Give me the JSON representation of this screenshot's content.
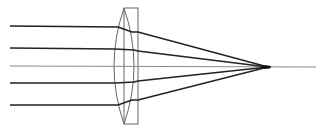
{
  "diagram": {
    "title": "",
    "elements": {
      "lens": "plano-convex lens",
      "rays": [
        "ray-1",
        "ray-2",
        "optical-axis",
        "ray-4",
        "ray-5"
      ],
      "focal_point": "focal-point"
    },
    "colors": {
      "ray": "#222222",
      "axis": "#8a8a8a",
      "lens": "#555555",
      "background": "#ffffff"
    }
  }
}
